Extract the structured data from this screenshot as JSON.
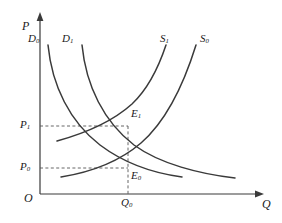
{
  "figure": {
    "type": "supply-demand-diagram",
    "stroke_color": "#3a3a3a",
    "dash_color": "#555555",
    "background": "#ffffff"
  },
  "axes": {
    "y_axis_label": "P",
    "x_axis_label": "Q",
    "origin_label": "O",
    "y_ticks": [
      {
        "label": "P",
        "sub": "1",
        "value_y": 126
      },
      {
        "label": "P",
        "sub": "0",
        "value_y": 168
      }
    ],
    "x_ticks": [
      {
        "label": "Q",
        "sub": "0",
        "value_x": 128
      }
    ]
  },
  "curves": [
    {
      "name": "D",
      "sub": "0",
      "kind": "demand",
      "label_x": 28,
      "label_y": 33
    },
    {
      "name": "D",
      "sub": "1",
      "kind": "demand",
      "label_x": 62,
      "label_y": 33
    },
    {
      "name": "S",
      "sub": "1",
      "kind": "supply",
      "label_x": 160,
      "label_y": 33
    },
    {
      "name": "S",
      "sub": "0",
      "kind": "supply",
      "label_x": 200,
      "label_y": 33
    }
  ],
  "equilibria": [
    {
      "name": "E",
      "sub": "1",
      "x": 128,
      "y": 126,
      "label_x": 131,
      "label_y": 110
    },
    {
      "name": "E",
      "sub": "0",
      "x": 128,
      "y": 168,
      "label_x": 131,
      "label_y": 170
    }
  ],
  "guides": {
    "horizontal": [
      {
        "from_x": 40,
        "to_x": 128,
        "y": 126
      },
      {
        "from_x": 40,
        "to_x": 128,
        "y": 168
      }
    ],
    "vertical": [
      {
        "x": 128,
        "from_y": 126,
        "to_y": 194
      }
    ]
  }
}
